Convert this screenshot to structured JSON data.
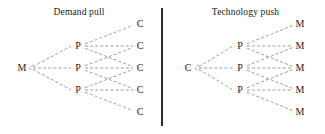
{
  "diagram": {
    "panels": [
      {
        "id": "demand-pull",
        "title": "Demand pull",
        "source": {
          "label": "M",
          "x": 22,
          "y": 68
        },
        "middle": {
          "label": "P",
          "x": 78,
          "nodes": [
            {
              "label": "P",
              "y": 46
            },
            {
              "label": "P",
              "y": 68
            },
            {
              "label": "P",
              "y": 90
            }
          ]
        },
        "targets": {
          "label": "C",
          "x": 140,
          "nodes": [
            {
              "label": "C",
              "y": 24
            },
            {
              "label": "C",
              "y": 46
            },
            {
              "label": "C",
              "y": 68
            },
            {
              "label": "C",
              "y": 90
            },
            {
              "label": "C",
              "y": 112
            }
          ]
        }
      },
      {
        "id": "technology-push",
        "title": "Technology push",
        "source": {
          "label": "C",
          "x": 188,
          "y": 68
        },
        "middle": {
          "label": "P",
          "x": 240,
          "nodes": [
            {
              "label": "P",
              "y": 46
            },
            {
              "label": "P",
              "y": 68
            },
            {
              "label": "P",
              "y": 90
            }
          ]
        },
        "targets": {
          "label": "M",
          "x": 300,
          "nodes": [
            {
              "label": "M",
              "y": 24
            },
            {
              "label": "M",
              "y": 46
            },
            {
              "label": "M",
              "y": 68
            },
            {
              "label": "M",
              "y": 90
            },
            {
              "label": "M",
              "y": 112
            }
          ]
        }
      }
    ],
    "edge_style": {
      "color": "#8c8c8c",
      "dashed": true
    },
    "divider": {
      "color": "#2b2b2b",
      "x": 161,
      "top": 8,
      "height": 118
    },
    "background": "#ffffff",
    "text_color": "#1a1a1a"
  }
}
